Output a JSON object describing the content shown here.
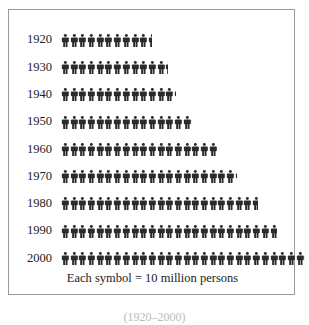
{
  "chart_data": {
    "type": "pictograph",
    "title": "",
    "unit_label": "Each symbol = 10 million persons",
    "unit_value": 10,
    "unit": "million persons",
    "categories": [
      "1920",
      "1930",
      "1940",
      "1950",
      "1960",
      "1970",
      "1980",
      "1990",
      "2000"
    ],
    "symbols": [
      10.5,
      12.3,
      13.2,
      15.1,
      17.9,
      20.3,
      22.7,
      24.9,
      28.1
    ],
    "values": [
      105,
      123,
      132,
      151,
      179,
      203,
      227,
      249,
      281
    ],
    "xlabel": "",
    "ylabel": "",
    "grid": false,
    "legend_position": "bottom"
  },
  "legend": {
    "text": "Each symbol = 10 million persons"
  },
  "caption": {
    "text": "(1920–2000)"
  },
  "colors": {
    "symbol": "#2b2b2b",
    "border": "#9a9a9a",
    "text": "#222222"
  }
}
